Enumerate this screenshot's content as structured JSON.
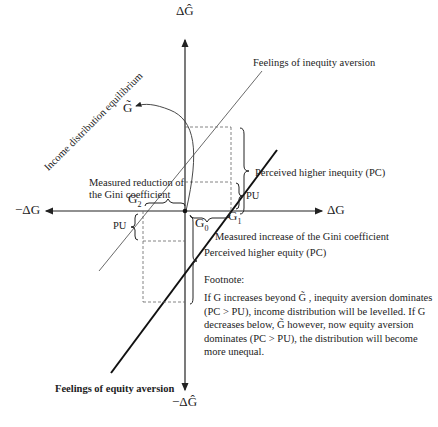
{
  "diagram": {
    "axes": {
      "y_pos": "ΔĜ",
      "y_neg": "−ΔĜ",
      "x_pos": "ΔG",
      "x_neg": "−ΔG"
    },
    "points": {
      "g_tilde": "G̃",
      "g0": "G",
      "g0_sub": "0",
      "g1": "G",
      "g1_sub": "1",
      "g2": "G",
      "g2_sub": "2"
    },
    "lines": {
      "inequity_aversion": "Feelings of inequity aversion",
      "equity_aversion": "Feelings of equity aversion"
    },
    "labels": {
      "equilibrium": "Income distribution equilibrium",
      "measured_reduction_1": "Measured reduction of",
      "measured_reduction_2": "the Gini coefficient",
      "measured_increase": "Measured increase of the Gini coefficient",
      "perceived_higher_inequity": "Perceived higher inequity (PC)",
      "perceived_higher_equity": "Perceived higher equity (PC)",
      "pu_upper": "PU",
      "pu_lower": "PU"
    },
    "footnote": {
      "title": "Footnote:",
      "text": "If G increases beyond G̃ , inequity aversion dominates (PC > PU), income distribution will be levelled. If G decreases below, G̃ however, now equity aversion dominates (PC > PU), the distribution will become more unequal."
    }
  }
}
